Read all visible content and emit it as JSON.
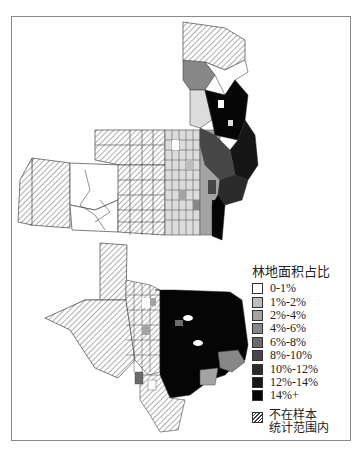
{
  "figure": {
    "type": "choropleth-map",
    "regions": [
      "Minnesota",
      "Nebraska",
      "Kansas",
      "Iowa/Missouri border area",
      "Colorado",
      "Texas"
    ]
  },
  "legend": {
    "title": "林地面积占比",
    "items": [
      {
        "label": "0-1%",
        "color": "#ffffff"
      },
      {
        "label": "1%-2%",
        "color": "#bdbdbd"
      },
      {
        "label": "2%-4%",
        "color": "#a3a3a3"
      },
      {
        "label": "4%-6%",
        "color": "#878787"
      },
      {
        "label": "6%-8%",
        "color": "#6a6a6a"
      },
      {
        "label": "8%-10%",
        "color": "#474747"
      },
      {
        "label": "10%-12%",
        "color": "#2b2b2b"
      },
      {
        "label": "12%-14%",
        "color": "#161616"
      },
      {
        "label": "14%+",
        "color": "#050505"
      }
    ],
    "not_in_sample": {
      "label_line1": "不在样本",
      "label_line2": "统计范围内",
      "pattern": "hatched"
    }
  }
}
